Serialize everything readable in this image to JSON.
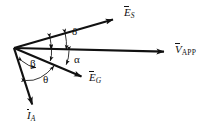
{
  "figure": {
    "kind": "phasor-diagram",
    "title": "",
    "background_color": "#ffffff",
    "line_color": "#111111",
    "width": 215,
    "height": 129,
    "origin": {
      "x": 14,
      "y": 48
    }
  },
  "vectors": [
    {
      "id": "es",
      "symbol": "E",
      "subscript": "S",
      "label": "E_S",
      "start": {
        "x": 14,
        "y": 48
      },
      "end": {
        "x": 118,
        "y": 18
      },
      "label_pos": {
        "x": 124,
        "y": 8
      }
    },
    {
      "id": "vapp",
      "symbol": "V",
      "subscript": "APP",
      "label": "V_APP",
      "start": {
        "x": 14,
        "y": 48
      },
      "end": {
        "x": 170,
        "y": 52
      },
      "label_pos": {
        "x": 175,
        "y": 44
      }
    },
    {
      "id": "eg",
      "symbol": "E",
      "subscript": "G",
      "label": "E_G",
      "start": {
        "x": 14,
        "y": 48
      },
      "end": {
        "x": 87,
        "y": 79
      },
      "label_pos": {
        "x": 90,
        "y": 78
      }
    },
    {
      "id": "ia",
      "symbol": "I",
      "subscript": "A",
      "label": "I_A",
      "start": {
        "x": 14,
        "y": 48
      },
      "end": {
        "x": 35,
        "y": 110
      },
      "label_pos": {
        "x": 27,
        "y": 114
      }
    }
  ],
  "angles": [
    {
      "id": "delta",
      "glyph": "δ",
      "name": "delta",
      "between": [
        "es",
        "vapp"
      ],
      "label_pos": {
        "x": 72,
        "y": 31
      }
    },
    {
      "id": "alpha",
      "glyph": "α",
      "name": "alpha",
      "between": [
        "vapp",
        "eg"
      ],
      "label_pos": {
        "x": 73,
        "y": 57
      }
    },
    {
      "id": "beta",
      "glyph": "β",
      "name": "beta",
      "between": [
        "ia",
        "eg"
      ],
      "label_pos": {
        "x": 31,
        "y": 60
      }
    },
    {
      "id": "theta",
      "glyph": "θ",
      "name": "theta",
      "between": [
        "ia",
        "vapp"
      ],
      "label_pos": {
        "x": 43,
        "y": 76
      }
    }
  ]
}
